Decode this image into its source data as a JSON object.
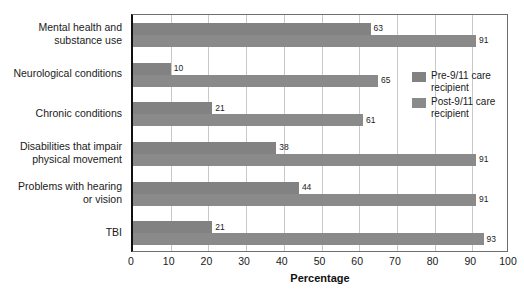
{
  "chart_data": {
    "type": "bar",
    "orientation": "horizontal",
    "title": "",
    "xlabel": "Percentage",
    "ylabel": "",
    "xlim": [
      0,
      100
    ],
    "xticks": [
      0,
      10,
      20,
      30,
      40,
      50,
      60,
      70,
      80,
      90,
      100
    ],
    "grid": true,
    "legend_position": "right",
    "categories": [
      "Mental health and\nsubstance use",
      "Neurological conditions",
      "Chronic conditions",
      "Disabilities that impair\nphysical movement",
      "Problems with hearing\nor vision",
      "TBI"
    ],
    "series": [
      {
        "name": "Pre-9/11 care recipient",
        "color": "#828282",
        "values": [
          63,
          10,
          21,
          38,
          44,
          21
        ]
      },
      {
        "name": "Post-9/11 care recipient",
        "color": "#8a8a8a",
        "values": [
          91,
          65,
          61,
          91,
          91,
          93
        ]
      }
    ]
  },
  "legend": {
    "items": [
      {
        "label": "Pre-9/11 care\nrecipient"
      },
      {
        "label": "Post-9/11 care\nrecipient"
      }
    ]
  },
  "axis": {
    "x_title": "Percentage"
  }
}
